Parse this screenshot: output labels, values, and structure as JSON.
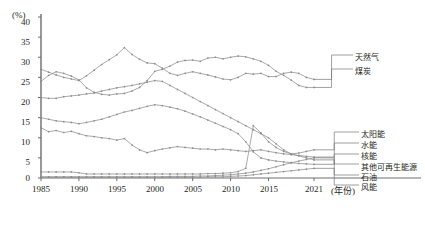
{
  "chart_data": {
    "type": "line",
    "title": "",
    "subtitle": "",
    "xlabel": "(年份)",
    "ylabel": "(%)",
    "ylim": [
      0,
      40
    ],
    "xlim": [
      1985,
      2021
    ],
    "grid": false,
    "legend_position": "inline-right",
    "y_ticks": [
      "40",
      "35",
      "30",
      "25",
      "20",
      "15",
      "10",
      "5",
      "0"
    ],
    "y_tick_values": [
      40,
      35,
      30,
      25,
      20,
      15,
      10,
      5,
      0
    ],
    "x_ticks": [
      "1985",
      "1990",
      "1995",
      "2000",
      "2005",
      "2010",
      "2015",
      "2021"
    ],
    "x_tick_values": [
      1985,
      1990,
      1995,
      2000,
      2005,
      2010,
      2015,
      2021
    ],
    "x": [
      1985,
      1986,
      1987,
      1988,
      1989,
      1990,
      1991,
      1992,
      1993,
      1994,
      1995,
      1996,
      1997,
      1998,
      1999,
      2000,
      2001,
      2002,
      2003,
      2004,
      2005,
      2006,
      2007,
      2008,
      2009,
      2010,
      2011,
      2012,
      2013,
      2014,
      2015,
      2016,
      2017,
      2018,
      2019,
      2020,
      2021
    ],
    "series": [
      {
        "name": "天然气",
        "label": "天然气",
        "color": "#8c8c8c",
        "values": [
          27.0,
          26.3,
          25.6,
          25.0,
          24.6,
          24.2,
          25.4,
          26.8,
          28.2,
          29.4,
          30.6,
          32.4,
          30.7,
          29.5,
          28.6,
          28.4,
          27.3,
          26.0,
          25.5,
          26.0,
          26.4,
          26.0,
          25.6,
          25.1,
          24.6,
          24.4,
          25.0,
          26.0,
          25.8,
          26.0,
          25.2,
          25.2,
          26.0,
          26.3,
          26.0,
          25.0,
          24.5
        ]
      },
      {
        "name": "煤炭",
        "label": "煤炭",
        "color": "#8c8c8c",
        "values": [
          24.0,
          25.5,
          26.4,
          26.0,
          25.3,
          24.4,
          22.4,
          21.3,
          20.8,
          20.6,
          20.9,
          21.0,
          21.6,
          22.5,
          24.2,
          26.5,
          27.0,
          27.8,
          28.8,
          29.2,
          29.3,
          29.0,
          29.8,
          30.0,
          29.6,
          30.0,
          30.3,
          30.1,
          29.6,
          29.0,
          28.0,
          26.5,
          25.5,
          24.3,
          23.0,
          22.5,
          22.5
        ]
      },
      {
        "name": "石油",
        "label": "石油",
        "color": "#8c8c8c",
        "values": [
          20.0,
          19.8,
          19.8,
          20.2,
          20.4,
          20.6,
          20.9,
          21.1,
          21.6,
          22.0,
          22.4,
          22.7,
          23.0,
          23.4,
          23.8,
          24.2,
          24.0,
          23.0,
          22.0,
          21.0,
          20.0,
          19.0,
          18.0,
          17.0,
          16.0,
          15.0,
          14.0,
          13.0,
          12.0,
          11.0,
          10.0,
          8.5,
          7.0,
          6.0,
          5.5,
          5.0,
          4.5
        ]
      },
      {
        "name": "核能",
        "label": "核能",
        "color": "#8c8c8c",
        "values": [
          15.0,
          14.6,
          14.2,
          14.0,
          13.8,
          13.5,
          13.8,
          14.2,
          14.6,
          15.2,
          15.8,
          16.4,
          16.8,
          17.3,
          17.8,
          18.2,
          18.0,
          17.6,
          17.2,
          16.6,
          15.9,
          15.2,
          14.4,
          13.6,
          12.8,
          12.0,
          11.0,
          9.0,
          6.5,
          5.0,
          4.5,
          4.2,
          4.0,
          3.8,
          3.6,
          3.5,
          3.4
        ]
      },
      {
        "name": "水能",
        "label": "水能",
        "color": "#8c8c8c",
        "values": [
          12.5,
          11.5,
          11.8,
          11.3,
          11.6,
          11.0,
          10.5,
          10.3,
          10.0,
          9.8,
          9.4,
          9.8,
          8.2,
          7.0,
          6.3,
          6.8,
          7.2,
          7.5,
          7.8,
          7.6,
          7.4,
          7.2,
          7.2,
          7.0,
          7.2,
          7.0,
          6.8,
          6.6,
          6.8,
          7.0,
          6.6,
          6.3,
          6.0,
          5.8,
          5.6,
          5.4,
          5.2
        ]
      },
      {
        "name": "太阳能",
        "label": "太阳能",
        "color": "#8c8c8c",
        "values": [
          1.5,
          1.5,
          1.5,
          1.5,
          1.5,
          1.3,
          1.0,
          1.0,
          1.0,
          1.0,
          1.0,
          1.0,
          1.0,
          1.0,
          1.0,
          1.0,
          1.0,
          1.0,
          1.0,
          1.0,
          1.0,
          1.0,
          1.1,
          1.1,
          1.2,
          1.3,
          1.6,
          2.4,
          13.0,
          11.2,
          9.0,
          7.6,
          6.6,
          6.0,
          6.2,
          6.6,
          7.0
        ]
      },
      {
        "name": "其他可再生能源",
        "label": "其他可再生能源",
        "color": "#8c8c8c",
        "values": [
          0.3,
          0.3,
          0.3,
          0.3,
          0.3,
          0.3,
          0.3,
          0.3,
          0.3,
          0.3,
          0.3,
          0.3,
          0.3,
          0.3,
          0.3,
          0.3,
          0.3,
          0.4,
          0.4,
          0.4,
          0.4,
          0.5,
          0.5,
          0.6,
          0.7,
          0.8,
          1.0,
          1.2,
          1.5,
          1.9,
          2.3,
          2.8,
          3.3,
          3.8,
          4.2,
          4.6,
          5.0
        ]
      },
      {
        "name": "风能",
        "label": "风能",
        "color": "#8c8c8c",
        "values": [
          0.2,
          0.2,
          0.2,
          0.2,
          0.2,
          0.2,
          0.2,
          0.2,
          0.2,
          0.2,
          0.2,
          0.2,
          0.2,
          0.2,
          0.2,
          0.2,
          0.2,
          0.2,
          0.2,
          0.2,
          0.2,
          0.2,
          0.3,
          0.3,
          0.3,
          0.4,
          0.5,
          0.6,
          0.8,
          1.0,
          1.2,
          1.4,
          1.6,
          1.8,
          2.0,
          2.2,
          2.4
        ]
      }
    ]
  },
  "labels": {
    "natural_gas": "天然气",
    "coal": "煤炭",
    "solar": "太阳能",
    "hydro": "水能",
    "nuclear": "核能",
    "other_renewables": "其他可再生能源",
    "oil": "石油",
    "wind": "风能",
    "y_unit": "(%)",
    "x_unit": "(年份)"
  },
  "y_ticks": {
    "t40": "40",
    "t35": "35",
    "t30": "30",
    "t25": "25",
    "t20": "20",
    "t15": "15",
    "t10": "10",
    "t5": "5",
    "t0": "0"
  },
  "x_ticks": {
    "x1985": "1985",
    "x1990": "1990",
    "x1995": "1995",
    "x2000": "2000",
    "x2005": "2005",
    "x2010": "2010",
    "x2015": "2015",
    "x2021": "2021"
  }
}
